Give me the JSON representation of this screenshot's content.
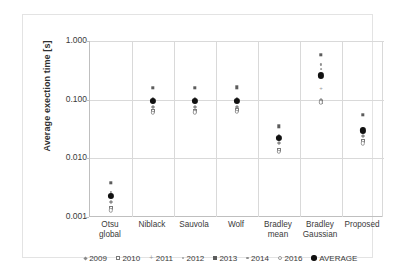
{
  "figure": {
    "background_color": "#ffffff",
    "frame_color": "#e3e3e3",
    "grid_color": "#d9d9d9",
    "axis_color": "#bfbfbf",
    "average_color": "#111111"
  },
  "chart_data": {
    "type": "scatter",
    "title": "",
    "xlabel": "",
    "ylabel": "Average exection time [s]",
    "yscale": "log",
    "ylim": [
      0.001,
      1.0
    ],
    "ytick_labels": [
      "1.000",
      "0.100",
      "0.010",
      "0.001"
    ],
    "ytick_values": [
      1.0,
      0.1,
      0.01,
      0.001
    ],
    "grid": true,
    "legend_position": "bottom",
    "categories": [
      "Otsu global",
      "Niblack",
      "Sauvola",
      "Wolf",
      "Bradley mean",
      "Bradley Gaussian",
      "Proposed"
    ],
    "category_lines": [
      [
        "Otsu",
        "global"
      ],
      [
        "Niblack",
        ""
      ],
      [
        "Sauvola",
        ""
      ],
      [
        "Wolf",
        ""
      ],
      [
        "Bradley",
        "mean"
      ],
      [
        "Bradley",
        "Gaussian"
      ],
      [
        "Proposed",
        ""
      ]
    ],
    "series": [
      {
        "name": "2009",
        "marker": "diamond",
        "values": [
          0.0018,
          0.074,
          0.075,
          0.076,
          0.018,
          0.1,
          0.024
        ]
      },
      {
        "name": "2010",
        "marker": "square-open",
        "values": [
          0.0014,
          0.064,
          0.065,
          0.066,
          0.014,
          0.093,
          0.02
        ]
      },
      {
        "name": "2011",
        "marker": "plus",
        "values": [
          0.0022,
          0.09,
          0.091,
          0.092,
          0.021,
          0.16,
          0.029
        ]
      },
      {
        "name": "2012",
        "marker": "dot-xs",
        "values": [
          0.0025,
          0.098,
          0.099,
          0.1,
          0.023,
          0.33,
          0.031
        ]
      },
      {
        "name": "2013",
        "marker": "square-fill",
        "values": [
          0.0038,
          0.16,
          0.158,
          0.162,
          0.035,
          0.58,
          0.055
        ]
      },
      {
        "name": "2014",
        "marker": "dot-sm",
        "values": [
          0.0027,
          0.105,
          0.106,
          0.107,
          0.025,
          0.4,
          0.033
        ]
      },
      {
        "name": "2016",
        "marker": "circle-open",
        "values": [
          0.0013,
          0.06,
          0.061,
          0.062,
          0.013,
          0.09,
          0.018
        ]
      },
      {
        "name": "AVERAGE",
        "marker": "avg",
        "values": [
          0.0023,
          0.094,
          0.095,
          0.096,
          0.022,
          0.26,
          0.03
        ]
      }
    ]
  },
  "legend": {
    "items": [
      {
        "label": "2009",
        "marker": "diamond"
      },
      {
        "label": "2010",
        "marker": "square-open"
      },
      {
        "label": "2011",
        "marker": "plus"
      },
      {
        "label": "2012",
        "marker": "dot-xs"
      },
      {
        "label": "2013",
        "marker": "square-fill"
      },
      {
        "label": "2014",
        "marker": "dot-sm"
      },
      {
        "label": "2016",
        "marker": "circle-open"
      },
      {
        "label": "AVERAGE",
        "marker": "avg"
      }
    ]
  }
}
